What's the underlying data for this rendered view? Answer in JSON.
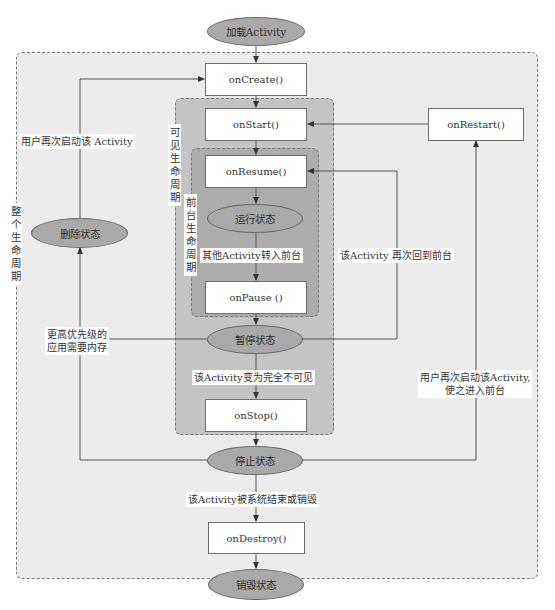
{
  "diagram": {
    "regions": {
      "entire_lifetime": "整个生命周期",
      "visible_lifetime": "可见生命周期",
      "foreground_lifetime": "前台生命周期"
    },
    "states": {
      "load": "加载Activity",
      "running": "运行状态",
      "paused": "暂停状态",
      "stopped": "停止状态",
      "destroyed": "销毁状态",
      "killed": "删除状态"
    },
    "callbacks": {
      "on_create": "onCreate()",
      "on_start": "onStart()",
      "on_resume": "onResume()",
      "on_pause": "onPause ()",
      "on_stop": "onStop()",
      "on_destroy": "onDestroy()",
      "on_restart": "onRestart()"
    },
    "transitions": {
      "user_restart": "用户再次启动该 Activity",
      "other_to_front": "其他Activity转入前台",
      "back_to_front": "该Activity 再次回到前台",
      "higher_priority_line1": "更高优先级的",
      "higher_priority_line2": "应用需要内存",
      "fully_invisible": "该Activity变为完全不可见",
      "user_restart_front_line1": "用户再次启动该Activity,",
      "user_restart_front_line2": "使之进入前台",
      "system_destroy": "该Activity被系统结束或销毁"
    },
    "colors": {
      "outer_region": "#ececec",
      "visible_region": "#c4c4c4",
      "foreground_region": "#acacac",
      "state_fill": "#a9a9a9",
      "node_fill": "#ffffff",
      "line": "#555555"
    }
  }
}
